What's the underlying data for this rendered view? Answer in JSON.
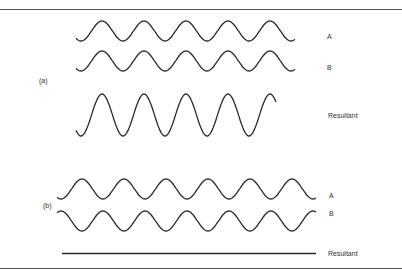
{
  "figure": {
    "part_a": {
      "label": "(a)",
      "waves": [
        {
          "name": "A",
          "label": "A"
        },
        {
          "name": "B",
          "label": "B"
        },
        {
          "name": "Resultant",
          "label": "Resultant"
        }
      ]
    },
    "part_b": {
      "label": "(b)",
      "waves": [
        {
          "name": "A",
          "label": "A"
        },
        {
          "name": "B",
          "label": "B"
        },
        {
          "name": "Resultant",
          "label": "Resultant"
        }
      ]
    }
  },
  "colors": {
    "stroke": "#2b2b2b",
    "border": "#555555",
    "text": "#333333"
  }
}
